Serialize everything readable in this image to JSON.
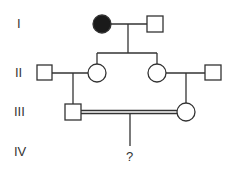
{
  "generations": [
    {
      "label": "I"
    },
    {
      "label": "II"
    },
    {
      "label": "III"
    },
    {
      "label": "IV"
    }
  ],
  "unknown_offspring": {
    "label": "?"
  },
  "colors": {
    "affected": "#1a1a1a",
    "line": "#333333"
  }
}
